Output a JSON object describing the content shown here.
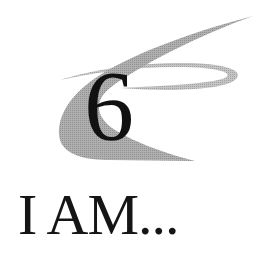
{
  "logo": {
    "number": "6",
    "swoosh_color": "#a8a8a8",
    "ring_color": "#b4b4b4",
    "icon": "swoosh-ring-emblem"
  },
  "tagline": {
    "text": "I AM..."
  },
  "colors": {
    "background": "#ffffff",
    "text": "#151515"
  }
}
